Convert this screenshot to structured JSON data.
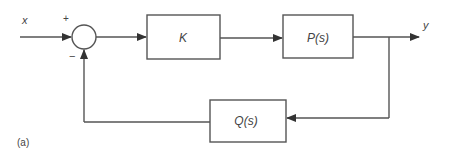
{
  "diagram": {
    "type": "feedback-control-block-diagram",
    "input_label": "x",
    "output_label": "y",
    "summing_junction": {
      "plus_sign": "+",
      "minus_sign": "−"
    },
    "blocks": [
      {
        "id": "controller",
        "label": "K"
      },
      {
        "id": "plant",
        "label": "P(s)"
      },
      {
        "id": "feedback",
        "label": "Q(s)"
      }
    ],
    "caption": "(a)",
    "colors": {
      "line": "#555555",
      "text": "#444444",
      "background": "#ffffff"
    }
  }
}
